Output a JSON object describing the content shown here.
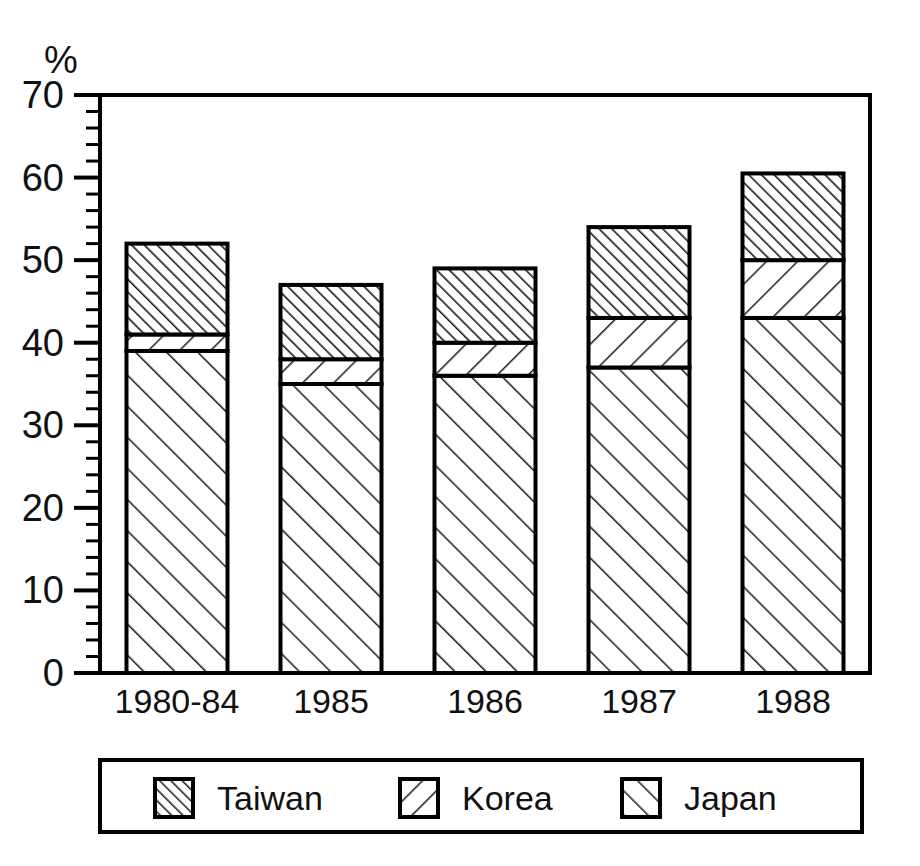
{
  "chart_data": {
    "type": "bar",
    "subtype": "stacked-bar",
    "title": "",
    "xlabel": "",
    "ylabel": "%",
    "ylim": [
      0,
      70
    ],
    "ytick_step": 10,
    "yminor_step": 2,
    "grid": false,
    "categories": [
      "1980-84",
      "1985",
      "1986",
      "1987",
      "1988"
    ],
    "ytick_labels": [
      "0",
      "10",
      "20",
      "30",
      "40",
      "50",
      "60",
      "70"
    ],
    "series": [
      {
        "name": "Japan",
        "values": [
          39,
          35,
          36,
          37,
          43
        ]
      },
      {
        "name": "Korea",
        "values": [
          2,
          3,
          4,
          6,
          7
        ]
      },
      {
        "name": "Taiwan",
        "values": [
          11,
          9,
          9,
          11,
          10.5
        ]
      }
    ],
    "stack_order_bottom_to_top": [
      "Japan",
      "Korea",
      "Taiwan"
    ],
    "cumulative_tops": {
      "Japan": [
        39,
        35,
        36,
        37,
        43
      ],
      "Korea": [
        41,
        38,
        40,
        43,
        50
      ],
      "Taiwan": [
        52,
        47,
        49,
        54,
        60.5
      ]
    },
    "totals": [
      52,
      47,
      49,
      54,
      60.5
    ],
    "legend_position": "bottom",
    "legend_entries": [
      {
        "label": "Taiwan",
        "pattern": "dense-forward-hatch"
      },
      {
        "label": "Korea",
        "pattern": "sparse-back-hatch"
      },
      {
        "label": "Japan",
        "pattern": "sparse-forward-hatch"
      }
    ],
    "colors": {
      "background": "#ffffff",
      "axis": "#000000",
      "hatch": "#1a1a1a",
      "fill": "#ffffff"
    }
  }
}
